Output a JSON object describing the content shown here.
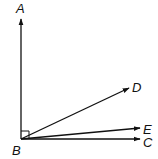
{
  "diagram": {
    "type": "geometry-angles",
    "vertex": {
      "label": "B",
      "x": 21,
      "y": 139
    },
    "rays": [
      {
        "id": "BA",
        "label": "A",
        "end": {
          "x": 21,
          "y": 19
        },
        "label_pos": {
          "x": 15,
          "y": 12
        }
      },
      {
        "id": "BD",
        "label": "D",
        "end": {
          "x": 129,
          "y": 88
        },
        "label_pos": {
          "x": 132,
          "y": 91
        }
      },
      {
        "id": "BE",
        "label": "E",
        "end": {
          "x": 140,
          "y": 128
        },
        "label_pos": {
          "x": 144,
          "y": 133
        }
      },
      {
        "id": "BC",
        "label": "C",
        "end": {
          "x": 140,
          "y": 141
        },
        "label_pos": {
          "x": 144,
          "y": 146
        }
      }
    ],
    "right_angle_marker": {
      "between": [
        "BA",
        "BC"
      ],
      "size": 8
    },
    "labels": {
      "A": "A",
      "B": "B",
      "C": "C",
      "D": "D",
      "E": "E"
    },
    "stroke_color": "#111111"
  }
}
